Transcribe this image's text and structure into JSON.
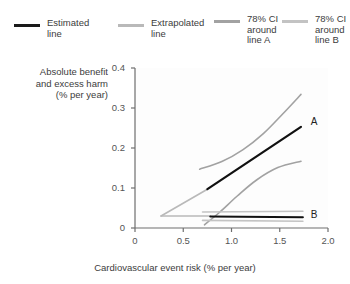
{
  "legend": {
    "items": [
      {
        "name": "estimated-line",
        "label": "Estimated\nline",
        "color": "#1a1a1a"
      },
      {
        "name": "extrapolated-line",
        "label": "Extrapolated\nline",
        "color": "#b9b9b9"
      },
      {
        "name": "ci-around-line-a",
        "label": "78% CI\naround\nline A",
        "color": "#a2a2a2"
      },
      {
        "name": "ci-around-line-b",
        "label": "78% CI\naround\nline B",
        "color": "#c3c3c3"
      }
    ]
  },
  "chart_data": {
    "type": "line",
    "title": "",
    "xlabel": "Cardiovascular event risk (% per year)",
    "ylabel": "Absolute benefit\nand excess harm\n(% per year)",
    "xlim": [
      0,
      2.0
    ],
    "ylim": [
      0,
      0.4
    ],
    "xticks": [
      0,
      0.5,
      1.0,
      1.5,
      2.0
    ],
    "xticklabels": [
      "0",
      "0.5",
      "1.0",
      "1.5",
      "2.0"
    ],
    "yticks": [
      0,
      0.1,
      0.2,
      0.3,
      0.4
    ],
    "yticklabels": [
      "0",
      "0.1",
      "0.2",
      "0.3",
      "0.4"
    ],
    "grid": false,
    "legend_position": "above-plot",
    "annotations": [
      {
        "text": "A",
        "x": 1.78,
        "y": 0.262
      },
      {
        "text": "B",
        "x": 1.78,
        "y": 0.031
      }
    ],
    "series": [
      {
        "name": "line-a-extrapolated",
        "label": "Extrapolated line A",
        "color": "#b9b9b9",
        "width": 1.6,
        "points": [
          [
            0.27,
            0.03
          ],
          [
            0.75,
            0.097
          ]
        ]
      },
      {
        "name": "line-a-estimated",
        "label": "Estimated line A",
        "color": "#111111",
        "width": 2.2,
        "points": [
          [
            0.75,
            0.097
          ],
          [
            1.72,
            0.253
          ]
        ]
      },
      {
        "name": "ci-a-upper",
        "label": "78% CI upper around line A",
        "color": "#a2a2a2",
        "width": 1.6,
        "points": [
          [
            0.67,
            0.147
          ],
          [
            0.9,
            0.166
          ],
          [
            1.12,
            0.196
          ],
          [
            1.33,
            0.236
          ],
          [
            1.53,
            0.285
          ],
          [
            1.72,
            0.334
          ]
        ]
      },
      {
        "name": "ci-a-lower",
        "label": "78% CI lower around line A",
        "color": "#a2a2a2",
        "width": 1.6,
        "points": [
          [
            0.72,
            0.008
          ],
          [
            0.88,
            0.04
          ],
          [
            1.06,
            0.08
          ],
          [
            1.26,
            0.12
          ],
          [
            1.48,
            0.151
          ],
          [
            1.72,
            0.167
          ]
        ]
      },
      {
        "name": "line-b-extrapolated",
        "label": "Extrapolated line B",
        "color": "#b9b9b9",
        "width": 1.6,
        "points": [
          [
            0.27,
            0.03
          ],
          [
            0.78,
            0.03
          ]
        ]
      },
      {
        "name": "line-b-estimated",
        "label": "Estimated line B",
        "color": "#111111",
        "width": 2.0,
        "points": [
          [
            0.78,
            0.029
          ],
          [
            1.74,
            0.027
          ]
        ]
      },
      {
        "name": "ci-b-upper",
        "label": "78% CI upper around line B",
        "color": "#c3c3c3",
        "width": 1.6,
        "points": [
          [
            0.7,
            0.04
          ],
          [
            1.74,
            0.042
          ]
        ]
      },
      {
        "name": "ci-b-lower",
        "label": "78% CI lower around line B",
        "color": "#c3c3c3",
        "width": 1.6,
        "points": [
          [
            0.7,
            0.019
          ],
          [
            1.74,
            0.017
          ]
        ]
      }
    ]
  }
}
